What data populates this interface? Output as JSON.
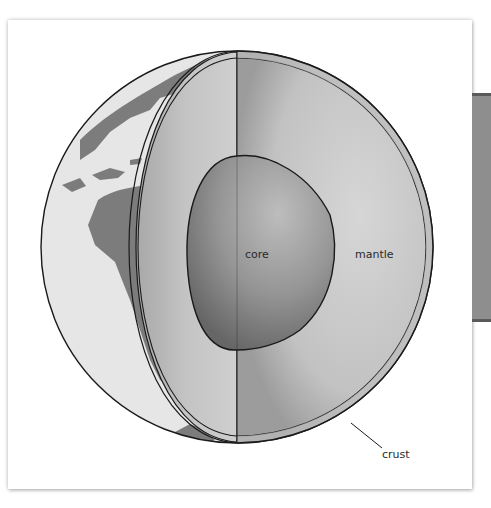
{
  "diagram": {
    "labels": {
      "core": "core",
      "mantle": "mantle",
      "crust": "crust"
    },
    "colors": {
      "background": "#ffffff",
      "ocean": "#e6e6e6",
      "land": "#7a7a7a",
      "mantle_light": "#d2d2d2",
      "mantle_dark": "#a4a4a4",
      "core_light": "#b4b4b4",
      "core_dark": "#6c6c6c",
      "crust": "#bdbdbd",
      "outline": "#1a1a1a",
      "side_panel": "#8e8e8e"
    }
  }
}
